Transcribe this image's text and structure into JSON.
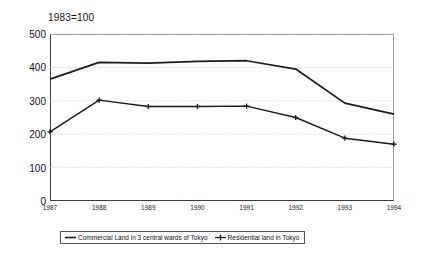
{
  "chart_data": {
    "type": "line",
    "title": "",
    "note": "1983=100",
    "xlabel": "",
    "ylabel": "",
    "categories": [
      "1987",
      "1988",
      "1989",
      "1990",
      "1991",
      "1992",
      "1993",
      "1994"
    ],
    "ylim": [
      0,
      500
    ],
    "yticks": [
      0,
      100,
      200,
      300,
      400,
      500
    ],
    "grid": true,
    "legend_position": "bottom",
    "series": [
      {
        "name": "Commercial Land in 3 central wards of Tokyo",
        "marker": "none",
        "color": "#1a1a1a",
        "values": [
          365,
          415,
          413,
          418,
          420,
          395,
          293,
          260
        ]
      },
      {
        "name": "Residential land in Tokyo",
        "marker": "plus",
        "color": "#1a1a1a",
        "values": [
          207,
          302,
          283,
          283,
          284,
          250,
          188,
          170
        ]
      }
    ]
  },
  "axis": {
    "y_labels": [
      "500",
      "400",
      "300",
      "200",
      "100",
      "0"
    ],
    "x_labels": [
      "1987",
      "1988",
      "1989",
      "1990",
      "1991",
      "1992",
      "1993",
      "1994"
    ]
  },
  "legend": {
    "items": [
      {
        "label": "Commercial Land in 3 central wards of Tokyo",
        "marker": "line"
      },
      {
        "label": "Residential land in Tokyo",
        "marker": "line-plus"
      }
    ]
  }
}
